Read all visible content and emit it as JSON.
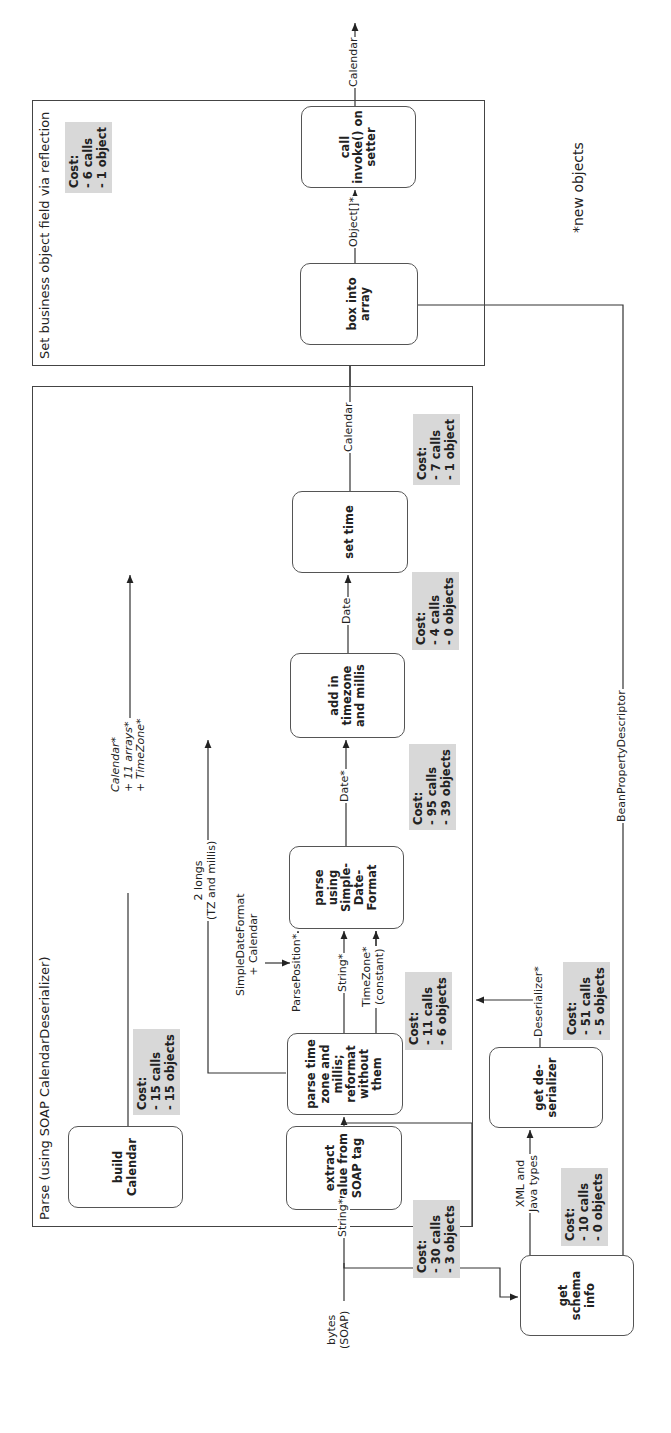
{
  "frames": {
    "parse": {
      "title": "Parse (using SOAP CalendarDeserializer)"
    },
    "set_field": {
      "title": "Set business object field via reflection"
    }
  },
  "boxes": {
    "extract": "extract value from SOAP tag",
    "parse_tz": "parse time zone and millis; reformat without them",
    "build_calendar": "build Calendar",
    "parse_sdf": "parse using Simple-Date-Format",
    "add_tz": "add in timezone and millis",
    "set_time": "set time",
    "box_array": "box into array",
    "call_invoke": "call invoke() on setter",
    "get_schema": "get schema info",
    "get_deserializer": "get de-serializer"
  },
  "costs": {
    "extract": "Cost:\n- 30 calls\n- 3 objects",
    "parse_tz": "Cost:\n- 11 calls\n- 6 objects",
    "build_calendar": "Cost:\n- 15 calls\n- 15 objects",
    "parse_sdf": "Cost:\n- 95 calls\n- 39 objects",
    "add_tz": "Cost:\n- 4 calls\n- 0 objects",
    "set_time": "Cost:\n- 7 calls\n- 1 object",
    "set_field": "Cost:\n- 6 calls\n- 1 object",
    "get_schema": "Cost:\n- 10 calls\n- 0 objects",
    "get_deserializer": "Cost:\n- 51 calls\n- 5 objects"
  },
  "edges": {
    "bytes_soap": "bytes\n(SOAP)",
    "string_1": "String*",
    "string_2": "String*",
    "two_longs": "2 longs\n(TZ and millis)",
    "sdf_calendar": "SimpleDateFormat\n+ Calendar",
    "parse_position": "ParsePosition*",
    "timezone_const": "TimeZone*\n(constant)",
    "date_star": "Date*",
    "date": "Date",
    "calendar_bundle": "Calendar*\n+ 11 arrays*\n+ TimeZone*",
    "calendar_out": "Calendar",
    "object_array": "Object[]*",
    "calendar_final": "Calendar",
    "xml_java_types": "XML and\nJava types",
    "deserializer": "Deserializer*",
    "bean_property": "BeanPropertyDescriptor"
  },
  "legend": {
    "new_objects": "*new objects"
  }
}
